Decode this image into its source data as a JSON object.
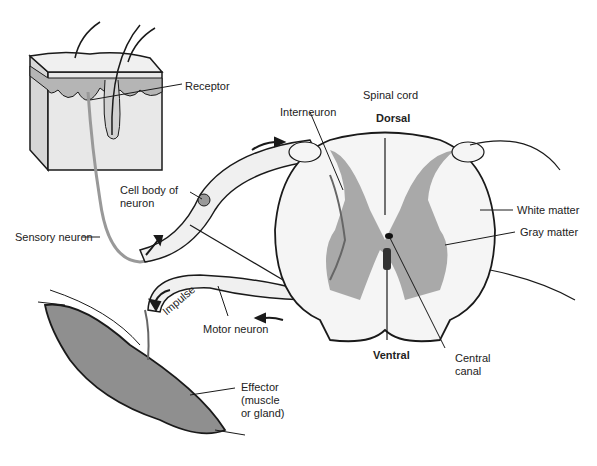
{
  "diagram": {
    "labels": {
      "receptor": "Receptor",
      "spinal_cord": "Spinal cord",
      "interneuron": "Interneuron",
      "dorsal": "Dorsal",
      "cell_body_line1": "Cell body of",
      "cell_body_line2": "neuron",
      "white_matter": "White matter",
      "gray_matter": "Gray matter",
      "sensory_neuron": "Sensory neuron",
      "impulse": "Impulse",
      "motor_neuron": "Motor neuron",
      "ventral": "Ventral",
      "central_canal_line1": "Central",
      "central_canal_line2": "canal",
      "effector_line1": "Effector",
      "effector_line2": "(muscle",
      "effector_line3": "or gland)"
    },
    "colors": {
      "outline": "#1a1a1a",
      "gray_matter": "#a9a9a9",
      "white_matter": "#f2f2f2",
      "skin_dermis": "#e8e8e8",
      "epidermis": "#b5b5b5",
      "muscle": "#8f8f8f"
    }
  }
}
